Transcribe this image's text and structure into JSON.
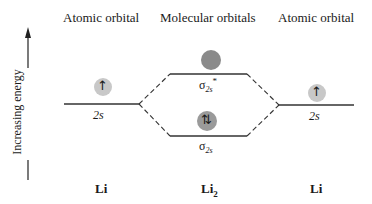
{
  "headers": {
    "left": "Atomic orbital",
    "center": "Molecular orbitals",
    "right": "Atomic orbital"
  },
  "y_axis": {
    "label": "Increasing energy",
    "direction": "up"
  },
  "levels": {
    "left_atomic": {
      "label": "2s",
      "electrons": "↑",
      "electron_count": 1
    },
    "antibonding": {
      "label_base": "σ",
      "label_sub": "2s",
      "label_sup": "*",
      "electrons": "",
      "electron_count": 0
    },
    "bonding": {
      "label_base": "σ",
      "label_sub": "2s",
      "electrons": "⇅",
      "electron_count": 2
    },
    "right_atomic": {
      "label": "2s",
      "electrons": "↑",
      "electron_count": 1
    }
  },
  "species": {
    "left": "Li",
    "center_base": "Li",
    "center_sub": "2",
    "right": "Li"
  },
  "colors": {
    "line": "#333333",
    "orbital_filled": "#c8c8c8",
    "orbital_empty": "#8a8a8a",
    "text": "#1a1a1a"
  }
}
